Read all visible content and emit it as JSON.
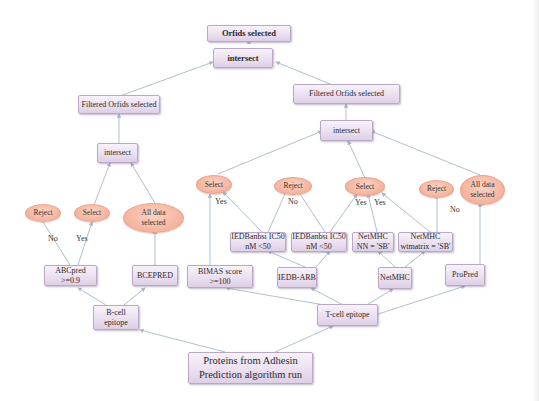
{
  "diagram": {
    "nodes": {
      "orfids_selected": "Orfids selected",
      "intersect_top": "intersect",
      "filtered_left": "Filtered Orfids selected",
      "filtered_right": "Filtered Orfids selected",
      "intersect_left": "intersect",
      "intersect_right": "intersect",
      "reject_b": "Reject",
      "select_b": "Select",
      "all_data_b": "All data\nselected",
      "abcpred": "ABCpred >=0.9",
      "bcepred": "BCEPRED",
      "b_cell": "B-cell epitope",
      "select_t1": "Select",
      "reject_t1": "Reject",
      "select_t2": "Select",
      "reject_t2": "Reject",
      "all_data_t": "All data\nselected",
      "iedb_ic50_1": "IEDBanbsi IC50\nnM <50",
      "iedb_ic50_2": "IEDBanbsi IC50\nnM <50",
      "netmhc_nn": "NetMHC\nNN = 'SB'",
      "netmhc_wm": "NetMHC\nwtmatrix = 'SB'",
      "bimas": "BIMAS score >=100",
      "iedb_arb": "IEDB-ARB",
      "netmhc": "NetMHC",
      "propred": "ProPred",
      "t_cell": "T-cell epitope",
      "proteins": "Proteins from Adhesin\nPrediction algorithm run"
    },
    "edge_labels": {
      "no_b": "No",
      "yes_b": "Yes",
      "yes_t1": "Yes",
      "no_t1": "No",
      "yes_t2a": "Yes",
      "yes_t2b": "Yes",
      "no_t2": "No"
    },
    "colors": {
      "box_fill": "#ebe0f0",
      "box_border": "#b9a8c6",
      "ellipse_fill": "#f5b29c",
      "connector": "#a8b8c8"
    }
  }
}
